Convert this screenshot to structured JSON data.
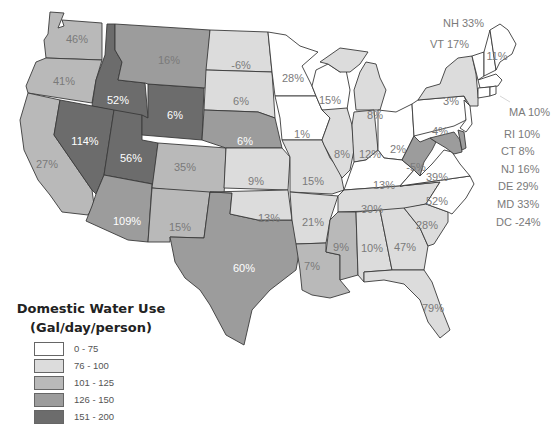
{
  "legend": {
    "title_line1": "Domestic Water Use",
    "title_line2": "(Gal/day/person)",
    "items": [
      {
        "label": "0 - 75",
        "color": "#ffffff"
      },
      {
        "label": "76 - 100",
        "color": "#dcdcdc"
      },
      {
        "label": "101 - 125",
        "color": "#b9b9b9"
      },
      {
        "label": "126 - 150",
        "color": "#9c9c9c"
      },
      {
        "label": "151 - 200",
        "color": "#6c6c6c"
      }
    ]
  },
  "states": [
    {
      "id": "WA",
      "value": "46%",
      "class": 3
    },
    {
      "id": "OR",
      "value": "41%",
      "class": 3
    },
    {
      "id": "CA",
      "value": "27%",
      "class": 3
    },
    {
      "id": "ID",
      "value": "52%",
      "class": 5
    },
    {
      "id": "NV",
      "value": "114%",
      "class": 5
    },
    {
      "id": "UT",
      "value": "56%",
      "class": 5
    },
    {
      "id": "WY",
      "value": "6%",
      "class": 5
    },
    {
      "id": "MT",
      "value": "16%",
      "class": 4
    },
    {
      "id": "AZ",
      "value": "109%",
      "class": 4
    },
    {
      "id": "CO",
      "value": "35%",
      "class": 3
    },
    {
      "id": "NM",
      "value": "15%",
      "class": 3
    },
    {
      "id": "TX",
      "value": "60%",
      "class": 4
    },
    {
      "id": "ND",
      "value": "-6%",
      "class": 2
    },
    {
      "id": "SD",
      "value": "6%",
      "class": 2
    },
    {
      "id": "NE",
      "value": "6%",
      "class": 4
    },
    {
      "id": "KS",
      "value": "9%",
      "class": 2
    },
    {
      "id": "OK",
      "value": "13%",
      "class": 2
    },
    {
      "id": "MN",
      "value": "28%",
      "class": 1
    },
    {
      "id": "IA",
      "value": "1%",
      "class": 1
    },
    {
      "id": "MO",
      "value": "15%",
      "class": 2
    },
    {
      "id": "AR",
      "value": "21%",
      "class": 2
    },
    {
      "id": "LA",
      "value": "7%",
      "class": 3
    },
    {
      "id": "WI",
      "value": "15%",
      "class": 1
    },
    {
      "id": "IL",
      "value": "8%",
      "class": 2
    },
    {
      "id": "MI",
      "value": "8%",
      "class": 2
    },
    {
      "id": "IN",
      "value": "12%",
      "class": 2
    },
    {
      "id": "OH",
      "value": "2%",
      "class": 1
    },
    {
      "id": "KY",
      "value": "13%",
      "class": 1
    },
    {
      "id": "TN",
      "value": "30%",
      "class": 2
    },
    {
      "id": "MS",
      "value": "9%",
      "class": 3
    },
    {
      "id": "AL",
      "value": "10%",
      "class": 2
    },
    {
      "id": "GA",
      "value": "47%",
      "class": 2
    },
    {
      "id": "FL",
      "value": "79%",
      "class": 2
    },
    {
      "id": "SC",
      "value": "28%",
      "class": 2
    },
    {
      "id": "NC",
      "value": "52%",
      "class": 1
    },
    {
      "id": "VA",
      "value": "39%",
      "class": 1
    },
    {
      "id": "WV",
      "value": "-5%",
      "class": 4
    },
    {
      "id": "PA",
      "value": "4%",
      "class": 1
    },
    {
      "id": "NY",
      "value": "3%",
      "class": 2
    },
    {
      "id": "ME",
      "value": "11%",
      "class": 1
    }
  ],
  "callouts": [
    {
      "id": "NH",
      "text": "NH 33%"
    },
    {
      "id": "VT",
      "text": "VT 17%"
    },
    {
      "id": "MA",
      "text": "MA 10%"
    },
    {
      "id": "RI",
      "text": "RI 10%"
    },
    {
      "id": "CT",
      "text": "CT 8%"
    },
    {
      "id": "NJ",
      "text": "NJ 16%"
    },
    {
      "id": "DE",
      "text": "DE 29%"
    },
    {
      "id": "MD",
      "text": "MD 33%"
    },
    {
      "id": "DC",
      "text": "DC -24%"
    }
  ]
}
